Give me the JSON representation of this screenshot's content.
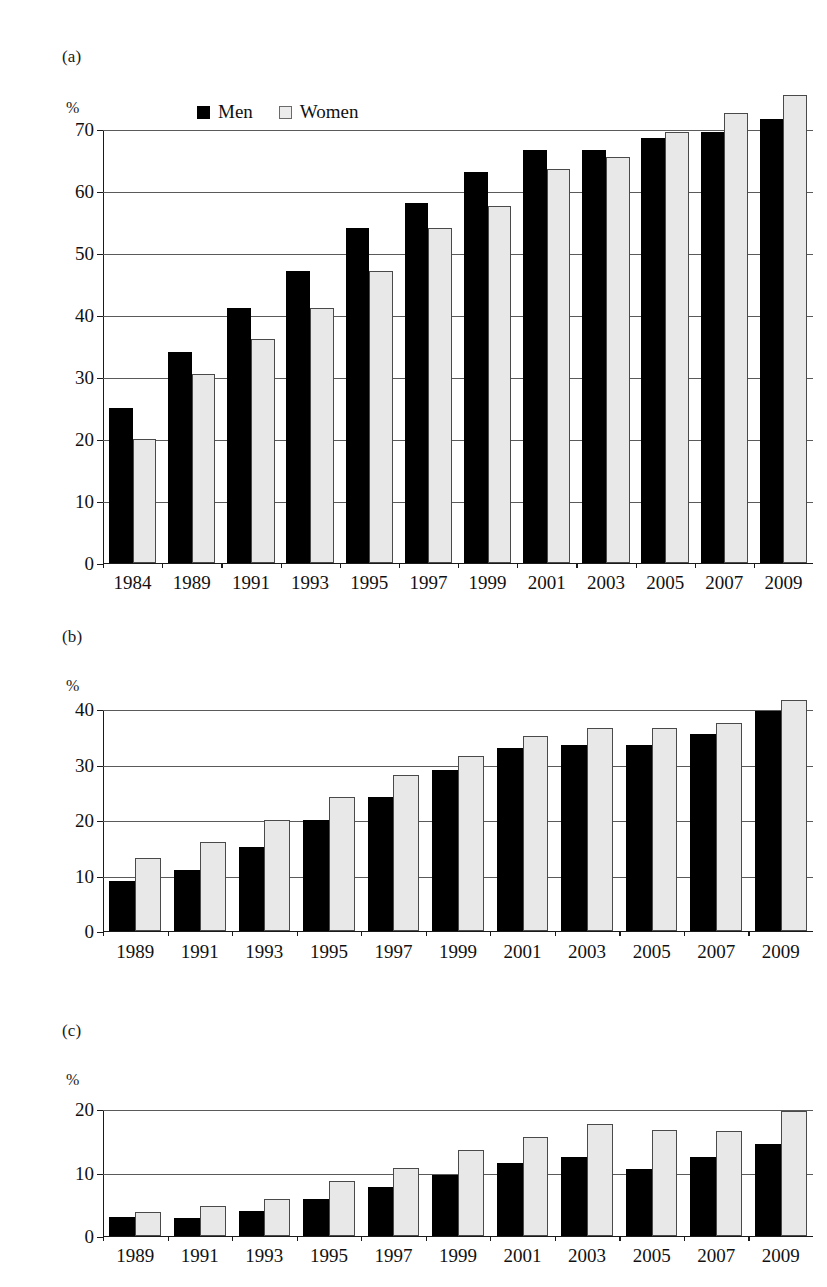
{
  "legend": {
    "men_label": "Men",
    "women_label": "Women",
    "men_swatch": "filled-square-icon",
    "women_swatch": "open-square-icon"
  },
  "axis_unit_label": "%",
  "panels": {
    "a": {
      "letter": "(a)"
    },
    "b": {
      "letter": "(b)"
    },
    "c": {
      "letter": "(c)"
    }
  },
  "colors": {
    "men_fill": "#000000",
    "women_fill": "#e8e8e8",
    "women_stroke": "#4a4a4a",
    "axis": "#1a1a1a",
    "gridline": "#5a5a5a",
    "background": "#ffffff"
  },
  "chart_data": [
    {
      "id": "a",
      "type": "bar",
      "title": "(a)",
      "xlabel": "",
      "ylabel": "%",
      "ylim": [
        0,
        70
      ],
      "yticks": [
        0,
        10,
        20,
        30,
        40,
        50,
        60,
        70
      ],
      "grid": true,
      "legend": [
        "Men",
        "Women"
      ],
      "legend_position": "top",
      "categories": [
        "1984",
        "1989",
        "1991",
        "1993",
        "1995",
        "1997",
        "1999",
        "2001",
        "2003",
        "2005",
        "2007",
        "2009"
      ],
      "series": [
        {
          "name": "Men",
          "values": [
            25.0,
            34.0,
            41.0,
            47.0,
            54.0,
            58.0,
            63.0,
            66.5,
            66.5,
            68.5,
            69.5,
            71.5
          ]
        },
        {
          "name": "Women",
          "values": [
            20.0,
            30.5,
            36.0,
            41.0,
            47.0,
            54.0,
            57.5,
            63.5,
            65.5,
            69.5,
            72.5,
            75.5
          ]
        }
      ]
    },
    {
      "id": "b",
      "type": "bar",
      "title": "(b)",
      "xlabel": "",
      "ylabel": "%",
      "ylim": [
        0,
        40
      ],
      "yticks": [
        0,
        10,
        20,
        30,
        40
      ],
      "grid": true,
      "legend": [
        "Men",
        "Women"
      ],
      "legend_position": "none",
      "categories": [
        "1989",
        "1991",
        "1993",
        "1995",
        "1997",
        "1999",
        "2001",
        "2003",
        "2005",
        "2007",
        "2009"
      ],
      "series": [
        {
          "name": "Men",
          "values": [
            9.0,
            11.0,
            15.0,
            20.0,
            24.0,
            29.0,
            33.0,
            33.5,
            33.5,
            35.5,
            39.5
          ]
        },
        {
          "name": "Women",
          "values": [
            13.0,
            16.0,
            20.0,
            24.0,
            28.0,
            31.5,
            35.0,
            36.5,
            36.5,
            37.5,
            41.5
          ]
        }
      ]
    },
    {
      "id": "c",
      "type": "bar",
      "title": "(c)",
      "xlabel": "",
      "ylabel": "%",
      "ylim": [
        0,
        20
      ],
      "yticks": [
        0,
        10,
        20
      ],
      "grid": true,
      "legend": [
        "Men",
        "Women"
      ],
      "legend_position": "none",
      "categories": [
        "1989",
        "1991",
        "1993",
        "1995",
        "1997",
        "1999",
        "2001",
        "2003",
        "2005",
        "2007",
        "2009"
      ],
      "series": [
        {
          "name": "Men",
          "values": [
            3.0,
            2.8,
            3.9,
            5.7,
            7.6,
            9.6,
            11.4,
            12.4,
            10.5,
            12.4,
            14.4
          ]
        },
        {
          "name": "Women",
          "values": [
            3.7,
            4.7,
            5.7,
            8.6,
            10.7,
            13.5,
            15.6,
            17.6,
            16.6,
            16.5,
            19.6
          ]
        }
      ]
    }
  ]
}
